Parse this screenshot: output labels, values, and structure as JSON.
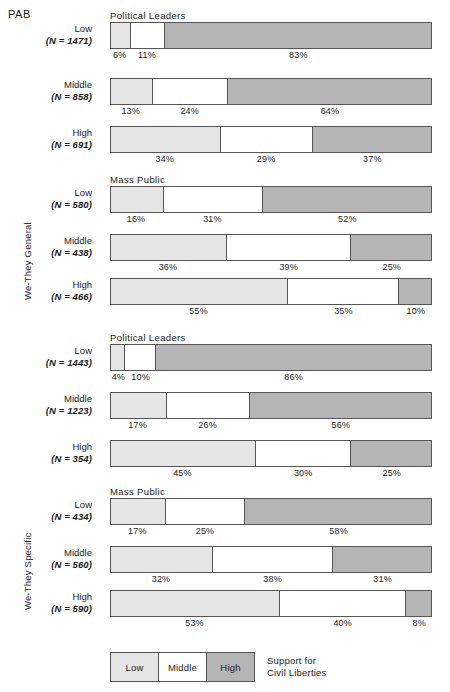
{
  "corner_label": "PAB",
  "legend": {
    "items": [
      {
        "key": "low",
        "label": "Low"
      },
      {
        "key": "middle",
        "label": "Middle"
      },
      {
        "key": "high",
        "label": "High"
      }
    ],
    "caption_line1": "Support for",
    "caption_line2": "Civil Liberties"
  },
  "colors": {
    "low": "#e6e6e6",
    "middle": "#ffffff",
    "high": "#b5b5b5",
    "outline": "#555555",
    "text": "#1a1a1a",
    "background": "#ffffff"
  },
  "chart_data": {
    "type": "bar",
    "orientation": "horizontal",
    "stacked": true,
    "percent_stacked": true,
    "title": "PAB",
    "xlabel": "",
    "ylabel": "",
    "xlim": [
      0,
      100
    ],
    "grid": false,
    "legend_position": "bottom-left",
    "legend_title": "Support for Civil Liberties",
    "series": [
      {
        "name": "Low",
        "color": "#e6e6e6"
      },
      {
        "name": "Middle",
        "color": "#ffffff"
      },
      {
        "name": "High",
        "color": "#b5b5b5"
      }
    ],
    "groups": [
      {
        "axis_label": "We-They General",
        "panels": [
          {
            "title": "Political Leaders",
            "rows": [
              {
                "category": "Low",
                "n_text": "(N = 1471)",
                "n": 1471,
                "values": [
                  6,
                  11,
                  83
                ],
                "labels": [
                  "6%",
                  "11%",
                  "83%"
                ]
              },
              {
                "category": "Middle",
                "n_text": "(N = 858)",
                "n": 858,
                "values": [
                  13,
                  24,
                  64
                ],
                "labels": [
                  "13%",
                  "24%",
                  "64%"
                ]
              },
              {
                "category": "High",
                "n_text": "(N = 691)",
                "n": 691,
                "values": [
                  34,
                  29,
                  37
                ],
                "labels": [
                  "34%",
                  "29%",
                  "37%"
                ]
              }
            ]
          },
          {
            "title": "Mass Public",
            "rows": [
              {
                "category": "Low",
                "n_text": "(N = 580)",
                "n": 580,
                "values": [
                  16,
                  31,
                  52
                ],
                "labels": [
                  "16%",
                  "31%",
                  "52%"
                ]
              },
              {
                "category": "Middle",
                "n_text": "(N = 438)",
                "n": 438,
                "values": [
                  36,
                  39,
                  25
                ],
                "labels": [
                  "36%",
                  "39%",
                  "25%"
                ]
              },
              {
                "category": "High",
                "n_text": "(N = 466)",
                "n": 466,
                "values": [
                  55,
                  35,
                  10
                ],
                "labels": [
                  "55%",
                  "35%",
                  "10%"
                ]
              }
            ]
          }
        ]
      },
      {
        "axis_label": "We-They Specific",
        "panels": [
          {
            "title": "Political Leaders",
            "rows": [
              {
                "category": "Low",
                "n_text": "(N = 1443)",
                "n": 1443,
                "values": [
                  4,
                  10,
                  86
                ],
                "labels": [
                  "4%",
                  "10%",
                  "86%"
                ]
              },
              {
                "category": "Middle",
                "n_text": "(N = 1223)",
                "n": 1223,
                "values": [
                  17,
                  26,
                  56
                ],
                "labels": [
                  "17%",
                  "26%",
                  "56%"
                ]
              },
              {
                "category": "High",
                "n_text": "(N = 354)",
                "n": 354,
                "values": [
                  45,
                  30,
                  25
                ],
                "labels": [
                  "45%",
                  "30%",
                  "25%"
                ]
              }
            ]
          },
          {
            "title": "Mass Public",
            "rows": [
              {
                "category": "Low",
                "n_text": "(N = 434)",
                "n": 434,
                "values": [
                  17,
                  25,
                  58
                ],
                "labels": [
                  "17%",
                  "25%",
                  "58%"
                ]
              },
              {
                "category": "Middle",
                "n_text": "(N = 560)",
                "n": 560,
                "values": [
                  32,
                  38,
                  31
                ],
                "labels": [
                  "32%",
                  "38%",
                  "31%"
                ]
              },
              {
                "category": "High",
                "n_text": "(N = 590)",
                "n": 590,
                "values": [
                  53,
                  40,
                  8
                ],
                "labels": [
                  "53%",
                  "40%",
                  "8%"
                ]
              }
            ]
          }
        ]
      }
    ]
  },
  "layout": {
    "row_tops": [
      22,
      78,
      126,
      186,
      234,
      278,
      344,
      392,
      440,
      498,
      546,
      590
    ],
    "panel_title_tops": [
      10,
      174,
      332,
      486
    ],
    "axis_label_positions": [
      {
        "left": 22,
        "top": 300
      },
      {
        "left": 22,
        "top": 610
      }
    ]
  }
}
